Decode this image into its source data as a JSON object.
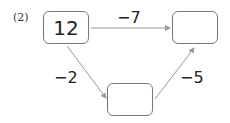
{
  "problem": {
    "label": "(2)"
  },
  "boxes": [
    {
      "id": "start",
      "value": "12"
    },
    {
      "id": "end",
      "value": ""
    },
    {
      "id": "middle",
      "value": ""
    }
  ],
  "operations": {
    "start_to_end": "−7",
    "start_to_middle": "−2",
    "middle_to_end": "−5"
  },
  "colors": {
    "arrow": "#999999",
    "box_border": "#777777"
  }
}
